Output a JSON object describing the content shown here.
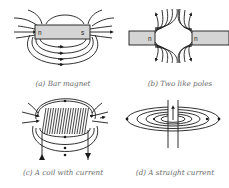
{
  "figure": {
    "panels": [
      {
        "id": "a",
        "caption": "(a) Bar magnet",
        "labels": {
          "left_pole": "n",
          "right_pole": "s"
        }
      },
      {
        "id": "b",
        "caption": "(b) Two like poles",
        "labels": {
          "left_pole": "n",
          "right_pole": "n"
        }
      },
      {
        "id": "c",
        "caption": "(c) A coil with current"
      },
      {
        "id": "d",
        "caption": "(d) A straight current"
      }
    ],
    "colors": {
      "lines": "#1a1a1a",
      "magnet_fill": "#d4d4d4",
      "caption": "#6a6a6a",
      "background": "#ffffff"
    }
  }
}
